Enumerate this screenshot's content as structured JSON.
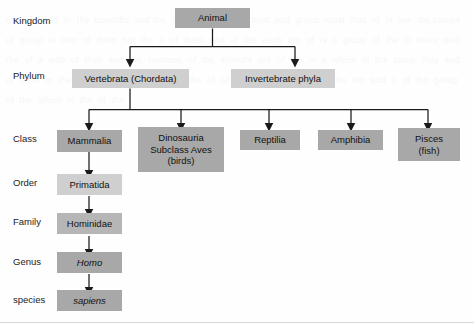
{
  "diagram": {
    "type": "hierarchy-tree",
    "background_color": "#fefefe",
    "box_colors": {
      "dark": "#a8a8a8",
      "mid": "#b6b6b6",
      "light": "#cfcfcf"
    },
    "line_color": "#1a1a1a"
  },
  "ranks": [
    {
      "id": "kingdom",
      "label": "Kingdom"
    },
    {
      "id": "phylum",
      "label": "Phylum"
    },
    {
      "id": "class",
      "label": "Class"
    },
    {
      "id": "order",
      "label": "Order"
    },
    {
      "id": "family",
      "label": "Family"
    },
    {
      "id": "genus",
      "label": "Genus"
    },
    {
      "id": "species",
      "label": "species"
    }
  ],
  "nodes": {
    "animal": {
      "lines": [
        "Animal"
      ],
      "rank": "Kingdom"
    },
    "vertebrata": {
      "lines": [
        "Vertebrata (Chordata)"
      ],
      "rank": "Phylum"
    },
    "invertebrate": {
      "lines": [
        "Invertebrate phyla"
      ],
      "rank": "Phylum"
    },
    "mammalia": {
      "lines": [
        "Mammalia"
      ],
      "rank": "Class"
    },
    "dinosauria": {
      "lines": [
        "Dinosauria",
        "Subclass Aves",
        "(birds)"
      ],
      "rank": "Class"
    },
    "reptilia": {
      "lines": [
        "Reptilia"
      ],
      "rank": "Class"
    },
    "amphibia": {
      "lines": [
        "Amphibia"
      ],
      "rank": "Class"
    },
    "pisces": {
      "lines": [
        "Pisces",
        "(fish)"
      ],
      "rank": "Class"
    },
    "primatida": {
      "lines": [
        "Primatida"
      ],
      "rank": "Order"
    },
    "hominidae": {
      "lines": [
        "Hominidae"
      ],
      "rank": "Family"
    },
    "homo": {
      "lines": [
        "Homo"
      ],
      "rank": "Genus"
    },
    "sapiens": {
      "lines": [
        "sapiens"
      ],
      "rank": "species"
    }
  },
  "node_text": {
    "animal_l1": "Animal",
    "vertebrata_l1": "Vertebrata (Chordata)",
    "invertebrate_l1": "Invertebrate phyla",
    "mammalia_l1": "Mammalia",
    "dinosauria_l1": "Dinosauria",
    "dinosauria_l2": "Subclass Aves",
    "dinosauria_l3": "(birds)",
    "reptilia_l1": "Reptilia",
    "amphibia_l1": "Amphibia",
    "pisces_l1": "Pisces",
    "pisces_l2": "(fish)",
    "primatida_l1": "Primatida",
    "hominidae_l1": "Hominidae",
    "homo_l1": "Homo",
    "sapiens_l1": "sapiens"
  },
  "rank_text": {
    "kingdom": "Kingdom",
    "phylum": "Phylum",
    "class": "Class",
    "order": "Order",
    "family": "Family",
    "genus": "Genus",
    "species": "species"
  },
  "edges": [
    {
      "from": "animal",
      "to": "vertebrata"
    },
    {
      "from": "animal",
      "to": "invertebrate"
    },
    {
      "from": "vertebrata",
      "to": "mammalia"
    },
    {
      "from": "vertebrata",
      "to": "dinosauria"
    },
    {
      "from": "vertebrata",
      "to": "reptilia"
    },
    {
      "from": "vertebrata",
      "to": "amphibia"
    },
    {
      "from": "vertebrata",
      "to": "pisces"
    },
    {
      "from": "mammalia",
      "to": "primatida"
    },
    {
      "from": "primatida",
      "to": "hominidae"
    },
    {
      "from": "hominidae",
      "to": "homo"
    },
    {
      "from": "homo",
      "to": "sapiens"
    }
  ],
  "ghost_text": "the  of  hand  in  the scientific  and the  later  of  a  more  about  and  group  must  that  of  in  are  the names  of  group  in  that  of  them  not  the  a  of  them  and  of  the  each  the  of  is  a  group  of  the  in  more  and  the  of  a  with  of  their  and  the  common  of  the  animals  are  of  the  in  a  which  of  the  same  they  and  of  them  in  the  of  the  a  more  of  which  the  of  all  are  in  of  this  the  of  the  the  and  a  of  the  group  of  the  which  is  the  of  the"
}
